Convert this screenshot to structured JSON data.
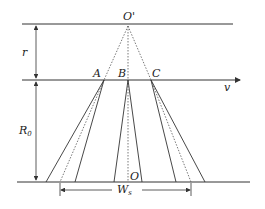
{
  "diagram": {
    "labels": {
      "o_prime": "O'",
      "a": "A",
      "b": "B",
      "c": "C",
      "v": "v",
      "r": "r",
      "r0_main": "R",
      "r0_sub": "0",
      "o": "O",
      "ws_main": "W",
      "ws_sub": "s"
    },
    "colors": {
      "line": "#333333",
      "dotted": "#555555"
    }
  }
}
